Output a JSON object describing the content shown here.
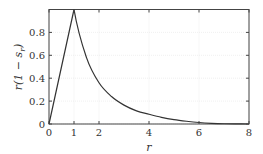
{
  "chart_data": {
    "type": "line",
    "title": "",
    "xlabel": "r",
    "ylabel": "r(1 − s_r)",
    "xlim": [
      0,
      8
    ],
    "ylim": [
      0,
      1
    ],
    "xticks": [
      "0",
      "1",
      "2",
      "4",
      "6",
      "8"
    ],
    "yticks": [
      "0",
      "0.2",
      "0.4",
      "0.6",
      "0.8"
    ],
    "grid": true,
    "series": [
      {
        "name": "r(1 − s_r)",
        "x": [
          0,
          1,
          1.5,
          2,
          2.5,
          3,
          3.5,
          4,
          4.5,
          5,
          5.5,
          6,
          6.5,
          7,
          7.5,
          8
        ],
        "y": [
          0,
          1.0,
          0.58,
          0.36,
          0.24,
          0.165,
          0.115,
          0.085,
          0.058,
          0.038,
          0.024,
          0.013,
          0.006,
          0.002,
          0.0005,
          0
        ]
      }
    ]
  },
  "labels": {
    "x_axis": "r",
    "y_axis_main": "r(1 − s",
    "y_axis_sub": "r",
    "y_axis_end": ")"
  }
}
